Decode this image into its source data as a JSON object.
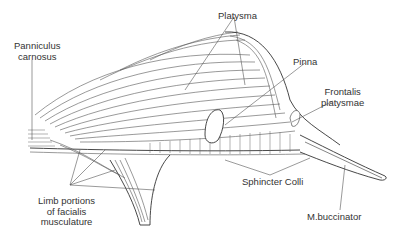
{
  "figure": {
    "labels": {
      "panniculus": [
        "Panniculus",
        "carnosus"
      ],
      "platysma": "Platysma",
      "pinna": "Pinna",
      "frontalis": [
        "Frontalis",
        "platysmae"
      ],
      "limb": [
        "Limb portions",
        "of facialis",
        "musculature"
      ],
      "sphincter": "Sphincter Colli",
      "buccinator": "M.buccinator"
    },
    "colors": {
      "line": "#444444",
      "text": "#333333",
      "background": "#ffffff"
    }
  }
}
